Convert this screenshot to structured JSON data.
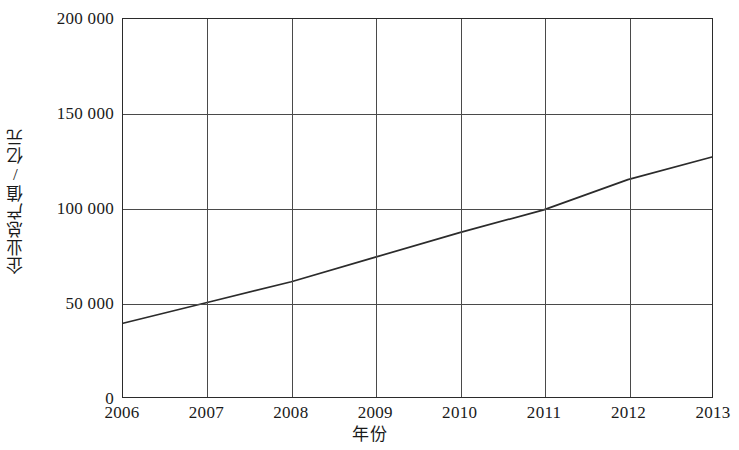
{
  "chart_data": {
    "type": "line",
    "title": "",
    "xlabel": "年份",
    "ylabel": "企业总产值/亿元",
    "x": [
      2006,
      2007,
      2008,
      2009,
      2010,
      2011,
      2012,
      2013
    ],
    "categories": [
      "2006",
      "2007",
      "2008",
      "2009",
      "2010",
      "2011",
      "2012",
      "2013"
    ],
    "series": [
      {
        "name": "企业总产值",
        "values": [
          39000,
          50000,
          61000,
          74000,
          87000,
          99000,
          115000,
          127000
        ]
      }
    ],
    "xlim": [
      2006,
      2013
    ],
    "ylim": [
      0,
      200000
    ],
    "y_ticks": [
      0,
      50000,
      100000,
      150000,
      200000
    ],
    "y_tick_labels": [
      "0",
      "50 000",
      "100 000",
      "150 000",
      "200 000"
    ],
    "x_ticks": [
      2006,
      2007,
      2008,
      2009,
      2010,
      2011,
      2012,
      2013
    ],
    "x_tick_labels": [
      "2006",
      "2007",
      "2008",
      "2009",
      "2010",
      "2011",
      "2012",
      "2013"
    ],
    "grid": true,
    "legend": false,
    "legend_position": "none",
    "line_color": "#2b2b2b",
    "background_color": "#ffffff",
    "grid_color": "#4a4a4a",
    "markers": false
  }
}
